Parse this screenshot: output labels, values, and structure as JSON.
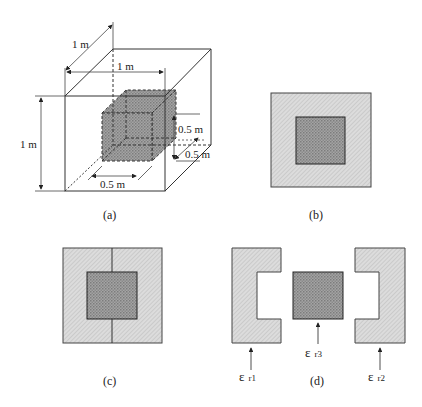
{
  "figure": {
    "panels": [
      {
        "id": "a",
        "caption": "(a)",
        "description": "Unit cube containing a centered smaller cube",
        "dimensions": {
          "outer_depth": "1 m",
          "outer_width": "1 m",
          "outer_height": "1 m",
          "inner_height": "0.5 m",
          "inner_depth": "0.5 m",
          "inner_width": "0.5 m"
        }
      },
      {
        "id": "b",
        "caption": "(b)",
        "description": "Cross-section: square with centered inner square"
      },
      {
        "id": "c",
        "caption": "(c)",
        "description": "Cross-section split into two halves by vertical line"
      },
      {
        "id": "d",
        "caption": "(d)",
        "description": "Exploded regions with permittivities",
        "labels": {
          "left": "ε r1",
          "center": "ε r3",
          "right": "ε r2"
        },
        "label_parts": {
          "left": {
            "symbol": "ε",
            "sub": "r1"
          },
          "center": {
            "symbol": "ε",
            "sub": "r3"
          },
          "right": {
            "symbol": "ε",
            "sub": "r2"
          }
        }
      }
    ],
    "colors": {
      "outer_fill": "#d6d6d6",
      "inner_fill": "#9a9a9a",
      "stroke": "#333333"
    }
  }
}
